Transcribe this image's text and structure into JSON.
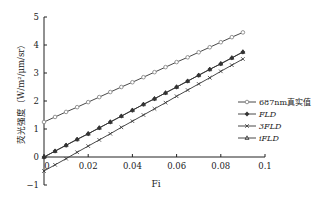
{
  "chart_data": {
    "type": "line",
    "title": "",
    "xlabel": "Fi",
    "ylabel": "荧光强度（W/m²/μm/sr）",
    "xlim": [
      0,
      0.1
    ],
    "ylim": [
      -1,
      5
    ],
    "x_ticks": [
      "0",
      "0.02",
      "0.04",
      "0.06",
      "0.08",
      "0.1"
    ],
    "y_ticks": [
      "-1",
      "0",
      "1",
      "2",
      "3",
      "4",
      "5"
    ],
    "grid": false,
    "legend_position": "right",
    "x": [
      0,
      0.005,
      0.01,
      0.015,
      0.02,
      0.025,
      0.03,
      0.035,
      0.04,
      0.045,
      0.05,
      0.055,
      0.06,
      0.065,
      0.07,
      0.075,
      0.08,
      0.085,
      0.09
    ],
    "series": [
      {
        "name": "687nm真实值",
        "marker": "circle-open",
        "values": [
          1.25,
          1.43,
          1.61,
          1.78,
          1.96,
          2.14,
          2.32,
          2.5,
          2.67,
          2.85,
          3.03,
          3.21,
          3.39,
          3.56,
          3.74,
          3.92,
          4.1,
          4.28,
          4.45
        ]
      },
      {
        "name": "FLD",
        "marker": "diamond-filled",
        "values": [
          0,
          0.21,
          0.42,
          0.63,
          0.83,
          1.04,
          1.25,
          1.46,
          1.67,
          1.88,
          2.08,
          2.29,
          2.5,
          2.71,
          2.92,
          3.13,
          3.33,
          3.54,
          3.75
        ]
      },
      {
        "name": "3FLD",
        "marker": "x",
        "values": [
          -0.5,
          -0.28,
          -0.06,
          0.17,
          0.39,
          0.61,
          0.83,
          1.06,
          1.28,
          1.5,
          1.72,
          1.94,
          2.17,
          2.39,
          2.61,
          2.83,
          3.06,
          3.28,
          3.5
        ]
      },
      {
        "name": "iFLD",
        "marker": "triangle-open",
        "values": [
          0,
          0.21,
          0.42,
          0.63,
          0.83,
          1.04,
          1.25,
          1.46,
          1.67,
          1.88,
          2.08,
          2.29,
          2.5,
          2.71,
          2.92,
          3.13,
          3.33,
          3.54,
          3.75
        ]
      }
    ]
  },
  "legend": {
    "items": [
      {
        "label": "687nm真实值"
      },
      {
        "label": "FLD"
      },
      {
        "label": "3FLD"
      },
      {
        "label": "iFLD"
      }
    ]
  },
  "colors": {
    "line": "#333333",
    "axis": "#222222",
    "marker_open": "#888888"
  }
}
